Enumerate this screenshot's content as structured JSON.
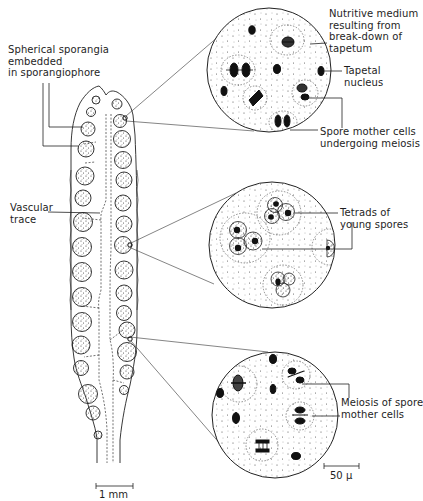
{
  "figure": {
    "labels": {
      "spherical_sporangia": "Spherical sporangia\nembedded\nin sporangiophore",
      "vascular_trace": "Vascular\ntrace",
      "nutritive_medium": "Nutritive medium\nresulting from\nbreak-down of\ntapetum",
      "tapetal_nucleus": "Tapetal\nnucleus",
      "spore_mother_cells": "Spore mother cells\nundergoing meiosis",
      "tetrads": "Tetrads of\nyoung spores",
      "meiosis": "Meiosis of spore\nmother cells"
    },
    "scale_bars": {
      "sporangiophore": "1 mm",
      "magnified": "50 μ"
    },
    "insets": [
      {
        "name": "top",
        "depicts": "Spore mother cells undergoing meiosis in nutritive medium"
      },
      {
        "name": "middle",
        "depicts": "Tetrads of young spores"
      },
      {
        "name": "bottom",
        "depicts": "Meiosis of spore mother cells"
      }
    ],
    "colors": {
      "ink": "#1a1a1a",
      "background": "#ffffff"
    }
  }
}
